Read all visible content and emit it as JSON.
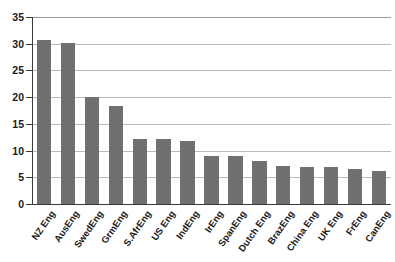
{
  "chart_data": {
    "type": "bar",
    "title": "",
    "subtitle": "",
    "xlabel": "",
    "ylabel": "",
    "ylim": [
      0,
      35
    ],
    "ytick_step": 5,
    "yticks": [
      0,
      5,
      10,
      15,
      20,
      25,
      30,
      35
    ],
    "grid": true,
    "grid_axis": "y",
    "legend": false,
    "legend_position": "none",
    "orientation": "vertical",
    "bar_color": "#707070",
    "categories": [
      "NZ Eng",
      "AusEng",
      "SwedEng",
      "GrmEng",
      "S.AfrEng",
      "US Eng",
      "IndEng",
      "IrEng",
      "SpanEng",
      "Dutch Eng",
      "BrazEng",
      "China Eng",
      "UK Eng",
      "FrEng",
      "CanEng"
    ],
    "values": [
      30.7,
      30.1,
      20.0,
      18.4,
      12.1,
      12.1,
      11.8,
      9.0,
      8.9,
      8.0,
      7.2,
      7.0,
      7.0,
      6.5,
      6.2
    ]
  },
  "axis": {
    "y_tick_labels": [
      "0",
      "5",
      "10",
      "15",
      "20",
      "25",
      "30",
      "35"
    ]
  },
  "colors": {
    "bar": "#707070",
    "grid": "#b9b9b9",
    "axis": "#3a3a3a",
    "text": "#1a1a1a",
    "background": "#ffffff"
  }
}
